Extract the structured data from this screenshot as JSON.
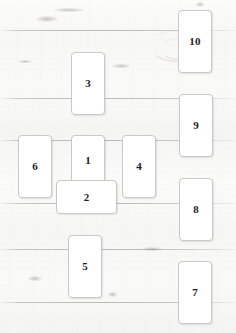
{
  "spread": {
    "name": "Celtic Cross Tarot Spread",
    "background": "light wood planks",
    "card_face_color": "#ffffff",
    "card_border_color": "#c9c9c7",
    "numeral_color": "#1d1d1d",
    "cards": [
      {
        "label": "1",
        "name": "card-1",
        "orientation": "vertical",
        "x": 71,
        "y": 135,
        "w": 34,
        "h": 50
      },
      {
        "label": "2",
        "name": "card-2",
        "orientation": "horizontal",
        "x": 56,
        "y": 180,
        "w": 61,
        "h": 34
      },
      {
        "label": "3",
        "name": "card-3",
        "orientation": "vertical",
        "x": 71,
        "y": 52,
        "w": 34,
        "h": 63
      },
      {
        "label": "4",
        "name": "card-4",
        "orientation": "vertical",
        "x": 122,
        "y": 135,
        "w": 34,
        "h": 63
      },
      {
        "label": "5",
        "name": "card-5",
        "orientation": "vertical",
        "x": 68,
        "y": 235,
        "w": 34,
        "h": 63
      },
      {
        "label": "6",
        "name": "card-6",
        "orientation": "vertical",
        "x": 18,
        "y": 135,
        "w": 34,
        "h": 63
      },
      {
        "label": "7",
        "name": "card-7",
        "orientation": "vertical",
        "x": 178,
        "y": 261,
        "w": 34,
        "h": 63
      },
      {
        "label": "8",
        "name": "card-8",
        "orientation": "vertical",
        "x": 179,
        "y": 178,
        "w": 34,
        "h": 63
      },
      {
        "label": "9",
        "name": "card-9",
        "orientation": "vertical",
        "x": 179,
        "y": 94,
        "w": 34,
        "h": 63
      },
      {
        "label": "10",
        "name": "card-10",
        "orientation": "vertical",
        "x": 178,
        "y": 10,
        "w": 34,
        "h": 63
      }
    ],
    "plank_seams_y": [
      30,
      98,
      140,
      203,
      249,
      302
    ]
  }
}
